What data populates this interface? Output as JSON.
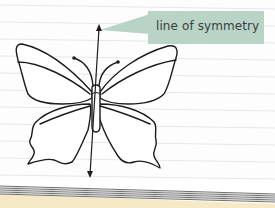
{
  "figure": {
    "callout": {
      "label": "line of symmetry",
      "background_color": "#b9d3c7",
      "text_color": "#3a3f3c"
    },
    "axis": {
      "type": "double-headed-arrow",
      "orientation": "vertical"
    },
    "paper": {
      "style": "lined",
      "line_color": "#e6eaec",
      "page_edge_color": "#6e6e6e",
      "bottom_strip_color": "#f5e9c6"
    }
  }
}
